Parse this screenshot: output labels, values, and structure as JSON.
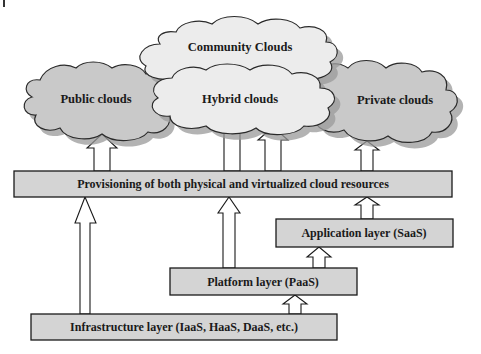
{
  "diagram": {
    "clouds": {
      "community": {
        "label": "Community Clouds"
      },
      "public": {
        "label": "Public clouds"
      },
      "hybrid": {
        "label": "Hybrid clouds"
      },
      "private": {
        "label": "Private clouds"
      }
    },
    "layers": {
      "provisioning": {
        "label": "Provisioning of both physical and virtualized cloud resources"
      },
      "application": {
        "label": "Application layer (SaaS)"
      },
      "platform": {
        "label": "Platform layer (PaaS)"
      },
      "infrastructure": {
        "label": "Infrastructure layer (IaaS, HaaS, DaaS, etc.)"
      }
    },
    "connections": [
      {
        "from": "provisioning",
        "to": "public"
      },
      {
        "from": "provisioning",
        "to": "hybrid"
      },
      {
        "from": "provisioning",
        "to": "private"
      },
      {
        "from": "infrastructure",
        "to": "provisioning"
      },
      {
        "from": "platform",
        "to": "provisioning"
      },
      {
        "from": "application",
        "to": "provisioning"
      },
      {
        "from": "platform",
        "to": "application"
      },
      {
        "from": "infrastructure",
        "to": "platform"
      }
    ],
    "colors": {
      "box_fill": "#d4d4d4",
      "cloud_dark": "#c9c9c9",
      "cloud_light": "#ececec"
    }
  }
}
